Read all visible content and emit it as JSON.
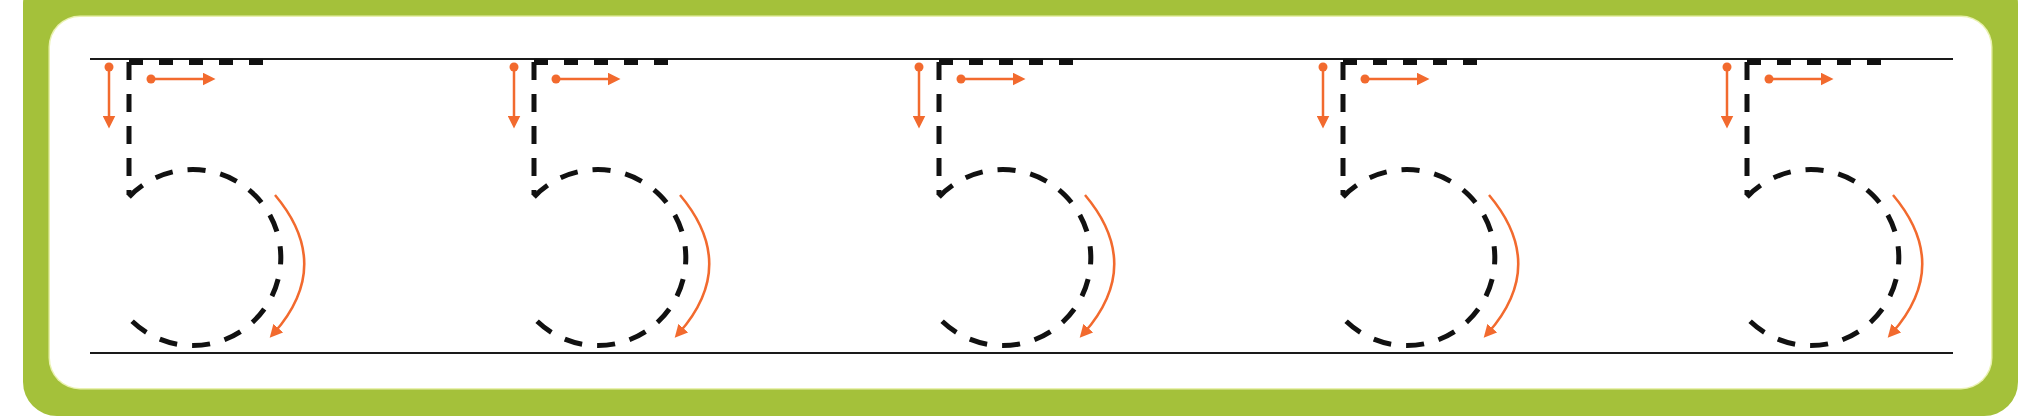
{
  "worksheet": {
    "title": "Number 5 tracing practice",
    "digit": "5",
    "repeat_count": 5,
    "colors": {
      "frame": "#a4c13a",
      "panel": "#ffffff",
      "guide_line": "#1a1a1a",
      "dashed_digit": "#111111",
      "arrow": "#f26a2e"
    },
    "guide_lines": {
      "top_y": 59,
      "bottom_y": 353,
      "x_start": 90,
      "x_end": 1953
    },
    "digits": [
      {
        "label": "5",
        "x": 129
      },
      {
        "label": "5",
        "x": 534
      },
      {
        "label": "5",
        "x": 939
      },
      {
        "label": "5",
        "x": 1343
      },
      {
        "label": "5",
        "x": 1747
      }
    ],
    "stroke_order": [
      {
        "step": 1,
        "icon": "arrow-down-icon",
        "description": "down stroke"
      },
      {
        "step": 2,
        "icon": "arrow-right-icon",
        "description": "top bar stroke"
      },
      {
        "step": 3,
        "icon": "arrow-curve-clockwise-icon",
        "description": "curved bowl stroke"
      }
    ]
  }
}
